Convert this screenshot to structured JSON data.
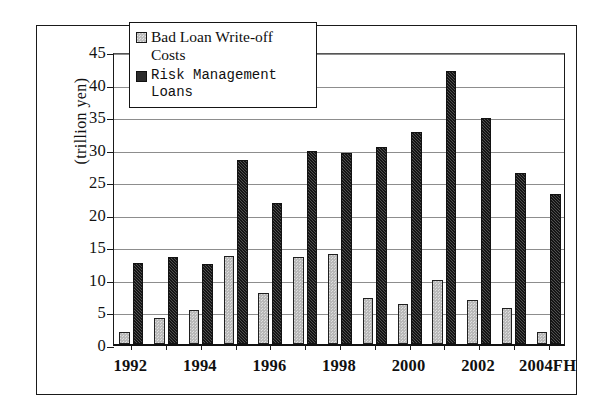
{
  "chart_data": {
    "type": "bar",
    "title": "",
    "xlabel": "",
    "ylabel": "(trillion yen)",
    "ylim": [
      0,
      45
    ],
    "yticks": [
      0,
      5,
      10,
      15,
      20,
      25,
      30,
      35,
      40,
      45
    ],
    "grid": true,
    "legend_position": "top-left",
    "categories": [
      "1992",
      "1993",
      "1994",
      "1995",
      "1996",
      "1997",
      "1998",
      "1999",
      "2000",
      "2001",
      "2002",
      "2003",
      "2004FH"
    ],
    "tick_labels": [
      "1992",
      "",
      "1994",
      "",
      "1996",
      "",
      "1998",
      "",
      "2000",
      "",
      "2002",
      "",
      "2004FH"
    ],
    "series": [
      {
        "name": "Bad Loan Write-off Costs",
        "color": "#b9b9b9",
        "values": [
          1.8,
          4.0,
          5.3,
          13.5,
          7.8,
          13.4,
          13.8,
          7.1,
          6.2,
          9.9,
          6.8,
          5.5,
          1.8
        ]
      },
      {
        "name": "Risk Management Loans",
        "color": "#3a3a3a",
        "values": [
          12.5,
          13.4,
          12.3,
          28.3,
          21.7,
          29.7,
          29.4,
          30.3,
          32.5,
          42.0,
          34.7,
          26.2,
          23.0
        ]
      }
    ]
  },
  "legend": {
    "entries": [
      {
        "label": "Bad Loan Write-off Costs",
        "swatch": "light-hatched-square"
      },
      {
        "label": "Risk Management Loans",
        "swatch": "dark-filled-square"
      }
    ]
  },
  "axes": {
    "y_title": "(trillion yen)"
  }
}
